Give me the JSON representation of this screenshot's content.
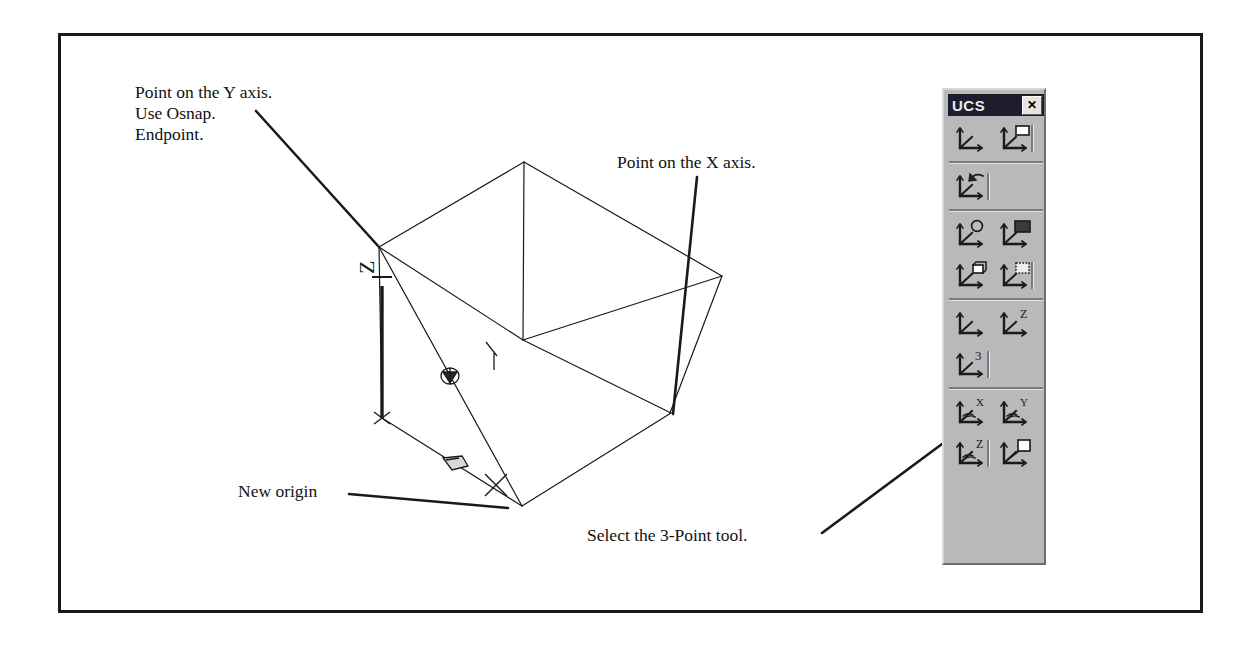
{
  "page": {
    "background": "#ffffff",
    "border_color": "#1a1a1a",
    "ink_color": "#111111"
  },
  "annotations": [
    {
      "name": "note-y-axis",
      "text": "Point on the Y axis.\nUse Osnap.\nEndpoint.",
      "x": 135,
      "y": 82,
      "leader": {
        "x1": 256,
        "y1": 111,
        "x2": 379,
        "y2": 247
      }
    },
    {
      "name": "note-x-axis",
      "text": "Point on the X axis.",
      "x": 617,
      "y": 152,
      "leader": {
        "x1": 697,
        "y1": 177,
        "x2": 673,
        "y2": 414
      }
    },
    {
      "name": "note-new-origin",
      "text": "New origin",
      "x": 238,
      "y": 481,
      "leader": {
        "x1": 349,
        "y1": 494,
        "x2": 508,
        "y2": 508
      }
    },
    {
      "name": "note-3point-tool",
      "text": "Select the 3-Point tool.",
      "x": 587,
      "y": 525,
      "leader": {
        "x1": 822,
        "y1": 533,
        "x2": 942,
        "y2": 444
      }
    }
  ],
  "drawing": {
    "name": "3d-wireframe-box",
    "description": "AutoCAD 3D box wireframe with UCS icon",
    "axis_labels": {
      "z": "Z"
    },
    "box_edges": [
      {
        "x1": 379,
        "y1": 247,
        "x2": 524,
        "y2": 162
      },
      {
        "x1": 524,
        "y1": 162,
        "x2": 722,
        "y2": 276
      },
      {
        "x1": 379,
        "y1": 247,
        "x2": 523,
        "y2": 340
      },
      {
        "x1": 523,
        "y1": 340,
        "x2": 722,
        "y2": 276
      },
      {
        "x1": 524,
        "y1": 162,
        "x2": 523,
        "y2": 340
      },
      {
        "x1": 722,
        "y1": 276,
        "x2": 670,
        "y2": 413
      },
      {
        "x1": 523,
        "y1": 340,
        "x2": 671,
        "y2": 413
      },
      {
        "x1": 671,
        "y1": 413,
        "x2": 522,
        "y2": 506
      },
      {
        "x1": 379,
        "y1": 247,
        "x2": 382,
        "y2": 418
      },
      {
        "x1": 382,
        "y1": 418,
        "x2": 522,
        "y2": 506
      },
      {
        "x1": 379,
        "y1": 247,
        "x2": 522,
        "y2": 506
      }
    ],
    "ucs_origin": {
      "x": 382,
      "y": 418
    },
    "snap_marker": {
      "x": 450,
      "y": 376
    },
    "cursor_marker": {
      "x": 452,
      "y": 462
    },
    "pick_cross": {
      "x": 496,
      "y": 485
    }
  },
  "toolbar": {
    "name": "ucs-toolbar",
    "title": "UCS",
    "close_label": "✕",
    "background": "#b9b9b9",
    "titlebar_color": "#1d1d2e",
    "groups": [
      {
        "rows": [
          [
            {
              "name": "ucs-world-button",
              "label": "UCS",
              "glyph": "axes-plain",
              "badge": "none",
              "vsep": false
            },
            {
              "name": "ucs-previous-button",
              "label": "Previous UCS",
              "glyph": "axes",
              "badge": "rect-white",
              "vsep": true
            }
          ]
        ]
      },
      {
        "rows": [
          [
            {
              "name": "ucs-restore-button",
              "label": "Restore UCS",
              "glyph": "axes",
              "badge": "arrow-curve",
              "vsep": true
            },
            {
              "name": "ucs-empty-1",
              "label": "",
              "glyph": "none",
              "badge": "none",
              "vsep": false
            }
          ]
        ]
      },
      {
        "rows": [
          [
            {
              "name": "ucs-world-globe-button",
              "label": "World UCS",
              "glyph": "axes",
              "badge": "globe",
              "vsep": false
            },
            {
              "name": "ucs-object-button",
              "label": "Object UCS",
              "glyph": "axes",
              "badge": "rect-dark",
              "vsep": false
            }
          ],
          [
            {
              "name": "ucs-face-button",
              "label": "Face UCS",
              "glyph": "axes",
              "badge": "cube",
              "vsep": false
            },
            {
              "name": "ucs-view-button",
              "label": "View UCS",
              "glyph": "axes",
              "badge": "rect-dotted",
              "vsep": true
            }
          ]
        ]
      },
      {
        "rows": [
          [
            {
              "name": "ucs-origin-button",
              "label": "Origin UCS",
              "glyph": "axes-plain",
              "badge": "none",
              "vsep": false
            },
            {
              "name": "ucs-zaxis-vector-button",
              "label": "Z Axis Vector UCS",
              "glyph": "axes",
              "badge": "letter-Z",
              "vsep": false
            }
          ],
          [
            {
              "name": "ucs-3point-button",
              "label": "3 Point UCS",
              "glyph": "axes",
              "badge": "letter-3",
              "vsep": true
            },
            {
              "name": "ucs-empty-2",
              "label": "",
              "glyph": "none",
              "badge": "none",
              "vsep": false
            }
          ]
        ]
      },
      {
        "rows": [
          [
            {
              "name": "ucs-rotate-x-button",
              "label": "X Axis Rotate UCS",
              "glyph": "axes-rot",
              "badge": "letter-X",
              "vsep": false
            },
            {
              "name": "ucs-rotate-y-button",
              "label": "Y Axis Rotate UCS",
              "glyph": "axes-rot",
              "badge": "letter-Y",
              "vsep": false
            }
          ],
          [
            {
              "name": "ucs-rotate-z-button",
              "label": "Z Axis Rotate UCS",
              "glyph": "axes-rot",
              "badge": "letter-Z",
              "vsep": true
            },
            {
              "name": "ucs-apply-button",
              "label": "Apply UCS",
              "glyph": "axes-apply",
              "badge": "windows",
              "vsep": false
            }
          ]
        ]
      }
    ]
  }
}
